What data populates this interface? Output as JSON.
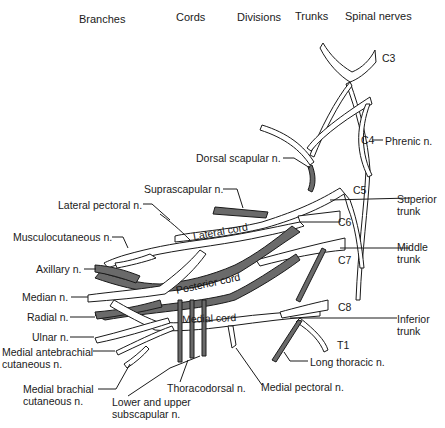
{
  "headers": {
    "branches": "Branches",
    "cords": "Cords",
    "divisions": "Divisions",
    "trunks": "Trunks",
    "spinal_nerves": "Spinal nerves"
  },
  "spinal_nerves": [
    "C3",
    "C4",
    "C5",
    "C6",
    "C7",
    "C8",
    "T1"
  ],
  "trunks": {
    "superior": "Superior trunk",
    "middle": "Middle trunk",
    "inferior": "Inferior trunk"
  },
  "cords": {
    "lateral": "Lateral cord",
    "posterior": "Posterior cord",
    "medial": "Medial cord"
  },
  "nerves": {
    "phrenic": "Phrenic n.",
    "dorsal_scapular": "Dorsal scapular n.",
    "suprascapular": "Suprascapular n.",
    "lateral_pectoral": "Lateral pectoral n.",
    "musculocutaneous": "Musculocutaneous n.",
    "axillary": "Axillary n.",
    "median": "Median n.",
    "radial": "Radial n.",
    "ulnar": "Ulnar n.",
    "medial_antebrachial_cutaneous": "Medial antebrachial cutaneous n.",
    "medial_brachial_cutaneous": "Medial brachial cutaneous n.",
    "lower_upper_subscapular": "Lower and upper subscapular n.",
    "thoracodorsal": "Thoracodorsal n.",
    "medial_pectoral": "Medial pectoral n.",
    "long_thoracic": "Long thoracic n."
  },
  "colors": {
    "posterior_fill": "#6a6a6a",
    "outline": "#1a1a1a",
    "background": "#ffffff"
  }
}
